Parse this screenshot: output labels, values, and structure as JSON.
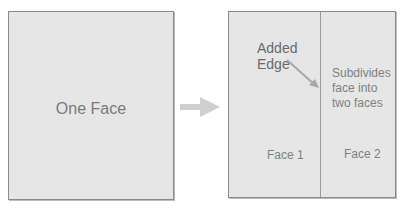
{
  "left_panel": {
    "label": "One Face"
  },
  "transition_arrow": {
    "icon": "right-arrow-icon",
    "color": "#c8c8c8"
  },
  "right_panel": {
    "annotation": {
      "line1": "Added",
      "line2": "Edge",
      "pointer_color": "#a0a0a0"
    },
    "description": "Subdivides face into two faces",
    "faces": [
      "Face 1",
      "Face 2"
    ]
  },
  "colors": {
    "box_fill": "#e6e6e6",
    "box_border": "#8a8a8a",
    "text": "#7a7a7a"
  }
}
